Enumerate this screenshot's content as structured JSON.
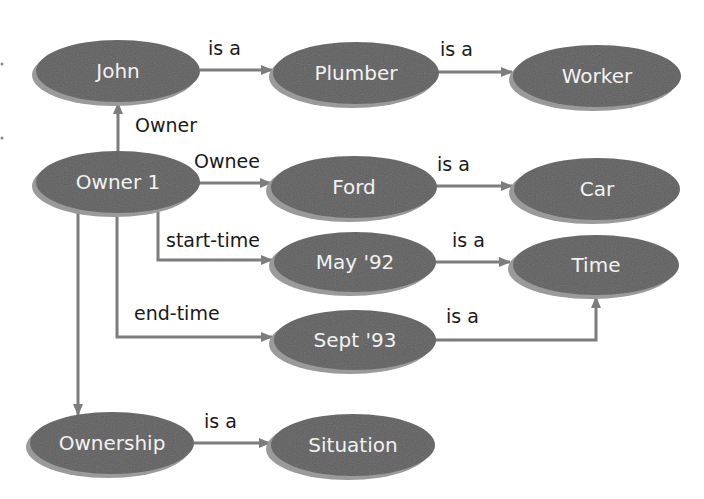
{
  "colors": {
    "node_fill": "#5e5e5e",
    "node_shadow": "#9a9a9a",
    "node_text": "#f2f2f2",
    "edge": "#7d7d7d",
    "edge_label": "#1a1a1a",
    "background": "#ffffff"
  },
  "nodes": {
    "john": {
      "label": "John"
    },
    "plumber": {
      "label": "Plumber"
    },
    "worker": {
      "label": "Worker"
    },
    "owner1": {
      "label": "Owner 1"
    },
    "ford": {
      "label": "Ford"
    },
    "car": {
      "label": "Car"
    },
    "may92": {
      "label": "May '92"
    },
    "time": {
      "label": "Time"
    },
    "sept93": {
      "label": "Sept '93"
    },
    "ownership": {
      "label": "Ownership"
    },
    "situation": {
      "label": "Situation"
    }
  },
  "edges": {
    "john_plumber": {
      "label": "is a"
    },
    "plumber_worker": {
      "label": "is a"
    },
    "owner1_john": {
      "label": "Owner"
    },
    "owner1_ford": {
      "label": "Ownee"
    },
    "ford_car": {
      "label": "is a"
    },
    "owner1_may92": {
      "label": "start-time"
    },
    "may92_time": {
      "label": "is a"
    },
    "owner1_sept93": {
      "label": "end-time"
    },
    "sept93_time": {
      "label": "is a"
    },
    "owner1_ownership": {
      "label": ""
    },
    "ownership_situation": {
      "label": "is a"
    }
  }
}
